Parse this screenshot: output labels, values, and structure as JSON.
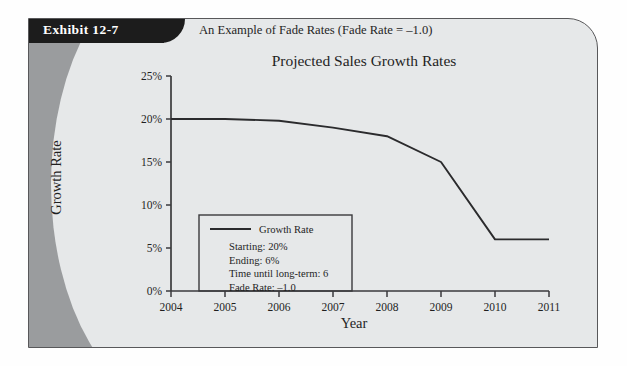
{
  "exhibit": {
    "badge_label": "Exhibit 12-7",
    "caption": "An Example of Fade Rates (Fade Rate = –1.0)"
  },
  "colors": {
    "panel_background": "#e6e8e9",
    "deco_band": "#9a9c9e",
    "badge_background": "#1c1c1c",
    "badge_text": "#ffffff",
    "axis": "#3a3a3c",
    "series_line": "#2b2b2d",
    "text": "#1f1f1f"
  },
  "legend": {
    "series_label": "Growth Rate",
    "lines": [
      "Starting:  20%",
      "Ending:  6%",
      "Time until long-term:  6",
      "Fade Rate:  –1.0"
    ]
  },
  "chart_data": {
    "type": "line",
    "title": "Projected Sales Growth Rates",
    "xlabel": "Year",
    "ylabel": "Growth Rate",
    "x": [
      2004,
      2005,
      2006,
      2007,
      2008,
      2009,
      2010,
      2011
    ],
    "xtick_labels": [
      "2004",
      "2005",
      "2006",
      "2007",
      "2008",
      "2009",
      "2010",
      "2011"
    ],
    "ytick_labels": [
      "0%",
      "5%",
      "10%",
      "15%",
      "20%",
      "25%"
    ],
    "ytick_values": [
      0,
      5,
      10,
      15,
      20,
      25
    ],
    "ylim": [
      0,
      25
    ],
    "xlim": [
      2004,
      2011
    ],
    "grid": false,
    "legend_position": "lower-left-inside",
    "series": [
      {
        "name": "Growth Rate",
        "values": [
          20.0,
          20.0,
          19.8,
          19.0,
          18.0,
          15.0,
          6.0,
          6.0
        ]
      }
    ]
  }
}
